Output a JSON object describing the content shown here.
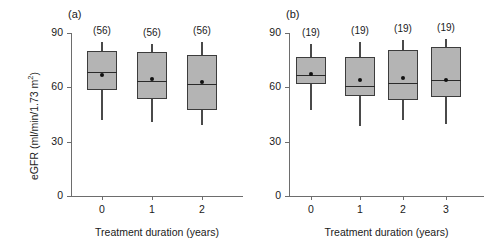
{
  "figure": {
    "ylabel": "eGFR (ml/min/1.73 m",
    "ylabel_sup": "2",
    "ylabel_close": ")",
    "xlabel": "Treatment duration (years)",
    "yticks": [
      "0",
      "30",
      "60",
      "90"
    ],
    "box_fill": "#b4b4b4",
    "box_stroke": "#3c3c3c",
    "axis_color": "#6d6d6d"
  },
  "panels": [
    {
      "label": "(a)",
      "xlabel": "Treatment duration (years)",
      "xticks": [
        "0",
        "1",
        "2"
      ],
      "counts": [
        "(56)",
        "(56)",
        "(56)"
      ]
    },
    {
      "label": "(b)",
      "xlabel": "Treatment duration (years)",
      "xticks": [
        "0",
        "1",
        "2",
        "3"
      ],
      "counts": [
        "(19)",
        "(19)",
        "(19)",
        "(19)"
      ]
    }
  ],
  "chart_data": {
    "type": "boxplot",
    "title": "",
    "xlabel": "Treatment duration (years)",
    "ylabel": "eGFR (ml/min/1.73 m2)",
    "ylim": [
      0,
      90
    ],
    "yticks": [
      0,
      30,
      60,
      90
    ],
    "grid": false,
    "legend": null,
    "panels": [
      {
        "panel": "(a)",
        "n_label": "(56)",
        "categories": [
          0,
          1,
          2
        ],
        "boxes": [
          {
            "x": 0,
            "n": 56,
            "whisker_low": 42.0,
            "q1": 58.5,
            "median": 68.5,
            "mean": 66.8,
            "q3": 80.0,
            "whisker_high": 85.0,
            "count_label": "(56)"
          },
          {
            "x": 1,
            "n": 56,
            "whisker_low": 41.0,
            "q1": 53.5,
            "median": 63.5,
            "mean": 64.5,
            "q3": 79.5,
            "whisker_high": 84.0,
            "count_label": "(56)"
          },
          {
            "x": 2,
            "n": 56,
            "whisker_low": 39.0,
            "q1": 47.5,
            "median": 62.0,
            "mean": 63.0,
            "q3": 78.0,
            "whisker_high": 85.0,
            "count_label": "(56)"
          }
        ]
      },
      {
        "panel": "(b)",
        "n_label": "(19)",
        "categories": [
          0,
          1,
          2,
          3
        ],
        "boxes": [
          {
            "x": 0,
            "n": 19,
            "whisker_low": 47.5,
            "q1": 62.0,
            "median": 67.0,
            "mean": 67.5,
            "q3": 77.0,
            "whisker_high": 84.0,
            "count_label": "(19)"
          },
          {
            "x": 1,
            "n": 19,
            "whisker_low": 38.5,
            "q1": 55.0,
            "median": 61.0,
            "mean": 64.0,
            "q3": 77.0,
            "whisker_high": 85.0,
            "count_label": "(19)"
          },
          {
            "x": 2,
            "n": 19,
            "whisker_low": 42.0,
            "q1": 53.0,
            "median": 62.5,
            "mean": 65.0,
            "q3": 80.5,
            "whisker_high": 86.0,
            "count_label": "(19)"
          },
          {
            "x": 3,
            "n": 19,
            "whisker_low": 39.5,
            "q1": 54.5,
            "median": 64.0,
            "mean": 64.0,
            "q3": 82.0,
            "whisker_high": 86.5,
            "count_label": "(19)"
          }
        ]
      }
    ]
  }
}
